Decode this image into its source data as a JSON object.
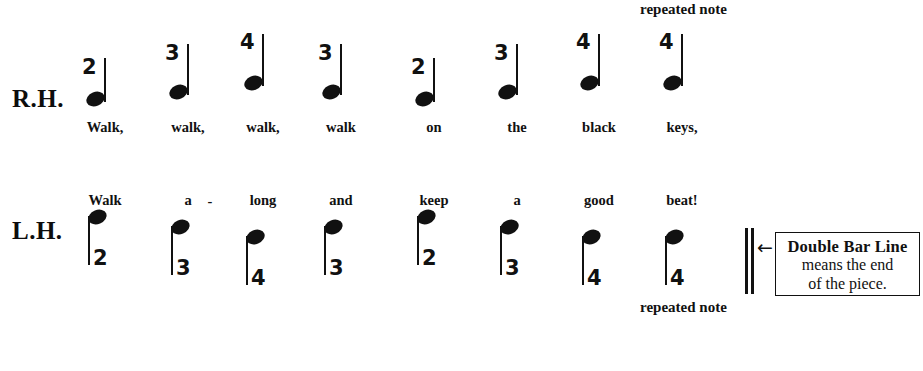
{
  "staves": [
    {
      "id": "right-hand",
      "label": "R.H.",
      "stem_direction": "up",
      "finger_number_position": "above",
      "lyric_position": "below",
      "notes": [
        {
          "finger": "2",
          "lyric": "Walk,"
        },
        {
          "finger": "3",
          "lyric": "walk,"
        },
        {
          "finger": "4",
          "lyric": "walk,"
        },
        {
          "finger": "3",
          "lyric": "walk"
        },
        {
          "finger": "2",
          "lyric": "on"
        },
        {
          "finger": "3",
          "lyric": "the"
        },
        {
          "finger": "4",
          "lyric": "black"
        },
        {
          "finger": "4",
          "lyric": "keys,"
        }
      ],
      "annotation": "repeated note"
    },
    {
      "id": "left-hand",
      "label": "L.H.",
      "stem_direction": "down",
      "finger_number_position": "below",
      "lyric_position": "above",
      "notes": [
        {
          "finger": "2",
          "lyric": "Walk"
        },
        {
          "finger": "3",
          "lyric": "a"
        },
        {
          "finger": "4",
          "lyric": "long"
        },
        {
          "finger": "3",
          "lyric": "and"
        },
        {
          "finger": "2",
          "lyric": "keep"
        },
        {
          "finger": "3",
          "lyric": "a"
        },
        {
          "finger": "4",
          "lyric": "good"
        },
        {
          "finger": "4",
          "lyric": "beat!"
        }
      ],
      "hyphen": "-",
      "annotation": "repeated note"
    }
  ],
  "callout": {
    "arrow": "←",
    "line1": "Double Bar Line",
    "line2": "means the end",
    "line3": "of the piece."
  },
  "colors": {
    "ink": "#111111",
    "background": "#ffffff"
  }
}
